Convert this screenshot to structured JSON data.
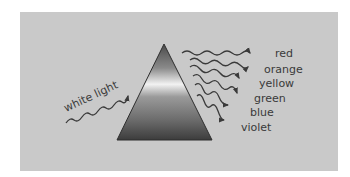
{
  "diagram": {
    "type": "prism-dispersion",
    "input_label": "white light",
    "prism": {
      "shape": "triangle",
      "fill": "metallic-gray-gradient"
    },
    "output_rays": [
      {
        "label": "red"
      },
      {
        "label": "orange"
      },
      {
        "label": "yellow"
      },
      {
        "label": "green"
      },
      {
        "label": "blue"
      },
      {
        "label": "violet"
      }
    ],
    "colors": {
      "background_panel": "#c9c9c9",
      "line": "#3a3a3a",
      "text": "#3a3a3a"
    }
  }
}
